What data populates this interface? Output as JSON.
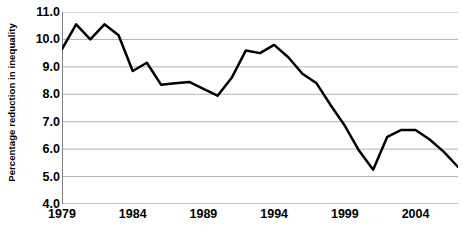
{
  "chart_data": {
    "type": "line",
    "title": "",
    "xlabel": "",
    "ylabel": "Percentage reduction in inequality",
    "xlim": [
      1979,
      2007
    ],
    "ylim": [
      4.0,
      11.0
    ],
    "ytick_step": 1.0,
    "yticks": [
      "11.0",
      "10.0",
      "9.0",
      "8.0",
      "7.0",
      "6.0",
      "5.0",
      "4.0"
    ],
    "ytick_values": [
      11.0,
      10.0,
      9.0,
      8.0,
      7.0,
      6.0,
      5.0,
      4.0
    ],
    "xticks": [
      "1979",
      "1984",
      "1989",
      "1994",
      "1999",
      "2004"
    ],
    "xtick_values": [
      1979,
      1984,
      1989,
      1994,
      1999,
      2004
    ],
    "grid": "horizontal",
    "legend": "none",
    "line_color": "#000000",
    "line_width": 2.5,
    "grid_color": "#b3b3b3",
    "axis_color": "#808080",
    "background": "#ffffff",
    "x": [
      1979,
      1980,
      1981,
      1982,
      1983,
      1984,
      1985,
      1986,
      1987,
      1988,
      1989,
      1990,
      1991,
      1992,
      1993,
      1994,
      1995,
      1996,
      1997,
      1998,
      1999,
      2000,
      2001,
      2002,
      2003,
      2004,
      2005,
      2006,
      2007
    ],
    "series": [
      {
        "name": "Percentage reduction in inequality",
        "values": [
          9.65,
          10.55,
          10.0,
          10.55,
          10.15,
          8.85,
          9.15,
          8.35,
          8.4,
          8.45,
          8.2,
          7.95,
          8.6,
          9.6,
          9.5,
          9.8,
          9.35,
          8.75,
          8.4,
          7.6,
          6.85,
          5.95,
          5.25,
          6.45,
          6.7,
          6.7,
          6.35,
          5.9,
          5.35
        ]
      }
    ]
  }
}
